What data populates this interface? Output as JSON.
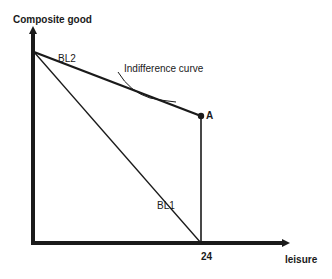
{
  "diagram": {
    "type": "labour-leisure budget constraint diagram",
    "y_axis_label": "Composite good",
    "x_axis_label": "leisure",
    "x_tick": "24",
    "lines": [
      {
        "id": "BL1",
        "label": "BL1"
      },
      {
        "id": "BL2",
        "label": "BL2"
      }
    ],
    "curve_label": "Indifference curve",
    "point_label": "A",
    "colors": {
      "ink": "#1a1a1a",
      "background": "#ffffff"
    }
  }
}
